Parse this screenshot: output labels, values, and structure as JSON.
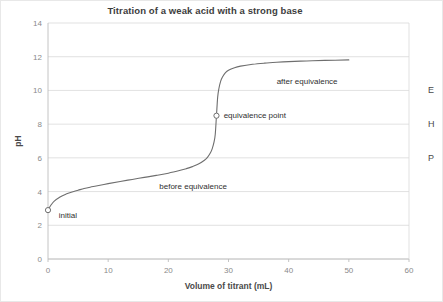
{
  "chart_data": {
    "type": "line",
    "title": "Titration of a weak acid with a strong base",
    "xlabel": "Volume of titrant (mL)",
    "ylabel": "pH",
    "xlim": [
      0,
      60
    ],
    "ylim": [
      0,
      14
    ],
    "grid": true,
    "legend": "none",
    "x_ticks": [
      "0",
      "10",
      "20",
      "30",
      "40",
      "50",
      "60"
    ],
    "y_ticks": [
      "0",
      "2",
      "4",
      "6",
      "8",
      "10",
      "12",
      "14"
    ],
    "x_tick_values": [
      0,
      10,
      20,
      30,
      40,
      50,
      60
    ],
    "y_tick_values": [
      0,
      2,
      4,
      6,
      8,
      10,
      12,
      14
    ],
    "series": [
      {
        "name": "titration curve",
        "x": [
          0,
          0.5,
          1,
          2,
          3,
          4,
          5,
          6,
          7,
          8,
          10,
          12,
          14,
          16,
          18,
          20,
          22,
          23,
          24,
          25,
          26,
          26.5,
          27,
          27.3,
          27.6,
          27.8,
          28,
          28.2,
          28.4,
          28.7,
          29,
          29.5,
          30,
          31,
          32,
          34,
          36,
          38,
          40,
          43,
          46,
          50
        ],
        "y": [
          2.9,
          3.2,
          3.42,
          3.68,
          3.85,
          3.98,
          4.08,
          4.18,
          4.26,
          4.33,
          4.47,
          4.6,
          4.72,
          4.84,
          4.96,
          5.09,
          5.26,
          5.36,
          5.48,
          5.63,
          5.86,
          6.03,
          6.3,
          6.55,
          6.95,
          7.4,
          8.5,
          9.6,
          10.1,
          10.55,
          10.8,
          11.05,
          11.2,
          11.35,
          11.44,
          11.55,
          11.62,
          11.67,
          11.71,
          11.75,
          11.78,
          11.81
        ]
      }
    ],
    "markers": [
      {
        "label": "initial",
        "x": 0,
        "y": 2.9,
        "marker": "open-circle"
      },
      {
        "label": "equivalence point",
        "x": 28,
        "y": 8.5,
        "marker": "open-circle"
      }
    ],
    "annotations": [
      {
        "text": "initial",
        "x": 1.8,
        "y": 2.6
      },
      {
        "text": "equivalence point",
        "x": 29.2,
        "y": 8.55
      },
      {
        "text": "before equivalence",
        "x": 18.5,
        "y": 4.35
      },
      {
        "text": "after equivalence",
        "x": 38,
        "y": 10.55
      }
    ]
  },
  "clipped_right_column": {
    "glyphs": [
      "E",
      "H",
      "P"
    ]
  }
}
